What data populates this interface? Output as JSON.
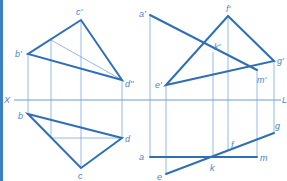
{
  "axis": {
    "left_label": "X",
    "right_label": "L",
    "y": 100,
    "x1": 14,
    "x2": 281
  },
  "colors": {
    "thick_line": "#2f6fb8",
    "thin_line": "#7aa8da",
    "label": "#4a86c6",
    "edge_bar": "#3d7fc4"
  },
  "left_figure": {
    "front_view": {
      "points": [
        {
          "label": "c'",
          "x": 81,
          "y": 20,
          "lx": 76,
          "ly": 15
        },
        {
          "label": "b'",
          "x": 28,
          "y": 54,
          "lx": 15,
          "ly": 57
        },
        {
          "label": "d''",
          "x": 122,
          "y": 80,
          "lx": 125,
          "ly": 87
        }
      ],
      "helper_line": {
        "x1": 51,
        "y1": 40,
        "x2": 122,
        "y2": 80
      }
    },
    "top_view": {
      "points": [
        {
          "label": "b",
          "x": 28,
          "y": 114,
          "lx": 18,
          "ly": 119
        },
        {
          "label": "d",
          "x": 122,
          "y": 138,
          "lx": 125,
          "ly": 142
        },
        {
          "label": "c",
          "x": 81,
          "y": 168,
          "lx": 78,
          "ly": 179
        }
      ],
      "helper_line": {
        "x1": 51,
        "y1": 138,
        "x2": 122,
        "y2": 138
      }
    },
    "projectors_x": [
      28,
      51,
      81,
      122
    ]
  },
  "right_figure": {
    "front_view": {
      "points": [
        {
          "label": "a'",
          "x": 150,
          "y": 15,
          "lx": 139,
          "ly": 17
        },
        {
          "label": "f'",
          "x": 228,
          "y": 16,
          "lx": 226,
          "ly": 12
        },
        {
          "label": "k'",
          "x": 213,
          "y": 52,
          "lx": 214,
          "ly": 50
        },
        {
          "label": "g'",
          "x": 274,
          "y": 61,
          "lx": 277,
          "ly": 64
        },
        {
          "label": "m'",
          "x": 257,
          "y": 70,
          "lx": 257,
          "ly": 83
        },
        {
          "label": "e'",
          "x": 166,
          "y": 85,
          "lx": 155,
          "ly": 88
        }
      ]
    },
    "top_view": {
      "points": [
        {
          "label": "a",
          "x": 150,
          "y": 157,
          "lx": 139,
          "ly": 160
        },
        {
          "label": "m",
          "x": 257,
          "y": 157,
          "lx": 260,
          "ly": 161
        },
        {
          "label": "f",
          "x": 228,
          "y": 151,
          "lx": 231,
          "ly": 148
        },
        {
          "label": "g",
          "x": 274,
          "y": 133,
          "lx": 275,
          "ly": 129
        },
        {
          "label": "k",
          "x": 213,
          "y": 156,
          "lx": 210,
          "ly": 171
        },
        {
          "label": "e",
          "x": 166,
          "y": 174,
          "lx": 157,
          "ly": 180
        }
      ]
    },
    "projectors_x": [
      150,
      166,
      213,
      228,
      257,
      274
    ]
  }
}
